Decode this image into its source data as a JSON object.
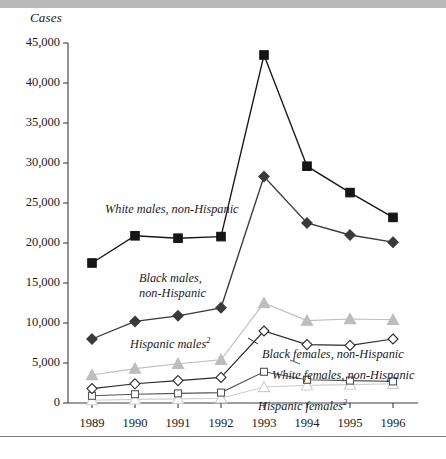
{
  "figure": {
    "y_axis_title": "Cases",
    "background": "#ffffff"
  },
  "chart_data": {
    "type": "line",
    "title": "",
    "xlabel": "",
    "ylabel": "Cases",
    "ylim": [
      0,
      45000
    ],
    "ytick_step": 5000,
    "grid": false,
    "legend": "inline-annotations",
    "categories": [
      "1989",
      "1990",
      "1991",
      "1992",
      "1993",
      "1994",
      "1995",
      "1996"
    ],
    "x": [
      1989,
      1990,
      1991,
      1992,
      1993,
      1994,
      1995,
      1996
    ],
    "ytick_labels": [
      "0",
      "5,000",
      "10,000",
      "15,000",
      "20,000",
      "25,000",
      "30,000",
      "35,000",
      "40,000",
      "45,000"
    ],
    "series": [
      {
        "name": "White males, non-Hispanic",
        "label": "White males, non-Hispanic",
        "marker": "filled-square",
        "color": "#161616",
        "marker_color": "#161616",
        "values": [
          17500,
          20900,
          20600,
          20800,
          43500,
          29600,
          26300,
          23200
        ]
      },
      {
        "name": "Black males, non-Hispanic",
        "label": "Black males, non-Hispanic",
        "marker": "filled-diamond",
        "color": "#3a3a3a",
        "marker_color": "#3a3a3a",
        "values": [
          8000,
          10200,
          10900,
          11900,
          28300,
          22500,
          21000,
          20100
        ]
      },
      {
        "name": "Hispanic males",
        "label": "Hispanic males",
        "footnote": "2",
        "marker": "filled-triangle",
        "color": "#bdbdbd",
        "marker_color": "#bdbdbd",
        "values": [
          3500,
          4300,
          4900,
          5400,
          12500,
          10300,
          10500,
          10400
        ]
      },
      {
        "name": "Black females, non-Hispanic",
        "label": "Black females, non-Hispanic",
        "marker": "open-diamond",
        "color": "#2b2b2b",
        "marker_color": "#ffffff",
        "values": [
          1800,
          2400,
          2800,
          3200,
          9000,
          7300,
          7200,
          8000
        ]
      },
      {
        "name": "White females, non-Hispanic",
        "label": "White females, non-Hispanic",
        "marker": "open-square",
        "color": "#555555",
        "marker_color": "#ffffff",
        "values": [
          900,
          1100,
          1200,
          1300,
          3900,
          2900,
          2800,
          2700
        ]
      },
      {
        "name": "Hispanic females",
        "label": "Hispanic females",
        "footnote": "2",
        "marker": "open-triangle",
        "color": "#cfcfcf",
        "marker_color": "#ffffff",
        "values": [
          350,
          450,
          520,
          600,
          2000,
          2200,
          2300,
          2400
        ]
      }
    ],
    "annotations": [
      {
        "text": "White males, non-Hispanic",
        "x": 105,
        "y": 203
      },
      {
        "text": "Black males,",
        "x": 139,
        "y": 272
      },
      {
        "text": "non-Hispanic",
        "x": 139,
        "y": 287
      },
      {
        "text": "Hispanic males",
        "sup": "2",
        "x": 130,
        "y": 334
      },
      {
        "text": "Black females, non-Hispanic",
        "x": 262,
        "y": 348
      },
      {
        "text": "White females, non-Hispanic",
        "x": 272,
        "y": 369
      },
      {
        "text": "Hispanic females",
        "sup": "2",
        "x": 258,
        "y": 396
      }
    ]
  }
}
